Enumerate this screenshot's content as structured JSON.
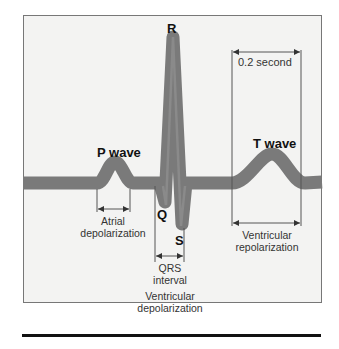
{
  "diagram": {
    "colors": {
      "background": "#f3f3f2",
      "trace": "#7a7a7a",
      "lines": "#444444",
      "text": "#222222"
    },
    "waves": {
      "p": "P wave",
      "t": "T wave"
    },
    "points": {
      "q": "Q",
      "r": "R",
      "s": "S"
    },
    "intervals": {
      "atrial": {
        "line1": "Atrial",
        "line2": "depolarization"
      },
      "qrs": {
        "line1": "QRS",
        "line2": "interval"
      },
      "ventricular_depol": {
        "line1": "Ventricular",
        "line2": "depolarization"
      },
      "ventricular_repol": {
        "line1": "Ventricular",
        "line2": "repolarization"
      },
      "time_scale": "0.2 second"
    }
  }
}
